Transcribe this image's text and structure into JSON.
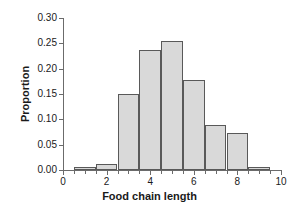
{
  "chart_data": {
    "type": "bar",
    "title": "",
    "xlabel": "Food chain length",
    "ylabel": "Proportion",
    "xlim": [
      0,
      10
    ],
    "ylim": [
      0,
      0.3
    ],
    "grid": false,
    "legend": null,
    "bin_width": 1,
    "categories": [
      "0.5-1.5",
      "1.5-2.5",
      "2.5-3.5",
      "3.5-4.5",
      "4.5-5.5",
      "5.5-6.5",
      "6.5-7.5",
      "7.5-8.5",
      "8.5-9.5"
    ],
    "bin_edges": [
      0.5,
      1.5,
      2.5,
      3.5,
      4.5,
      5.5,
      6.5,
      7.5,
      8.5,
      9.5
    ],
    "bin_centers": [
      1,
      2,
      3,
      4,
      5,
      6,
      7,
      8,
      9
    ],
    "values": [
      0.005,
      0.012,
      0.15,
      0.237,
      0.255,
      0.178,
      0.089,
      0.073,
      0.006
    ],
    "xticks": [
      0,
      0.5,
      1,
      1.5,
      2,
      2.5,
      3,
      3.5,
      4,
      4.5,
      5,
      5.5,
      6,
      6.5,
      7,
      7.5,
      8,
      8.5,
      9,
      9.5,
      10
    ],
    "xtick_labels": [
      {
        "value": 0,
        "label": "0"
      },
      {
        "value": 2,
        "label": "2"
      },
      {
        "value": 4,
        "label": "4"
      },
      {
        "value": 6,
        "label": "6"
      },
      {
        "value": 8,
        "label": "8"
      },
      {
        "value": 10,
        "label": "10"
      }
    ],
    "yticks": [
      0,
      0.05,
      0.1,
      0.15,
      0.2,
      0.25,
      0.3
    ],
    "ytick_labels": [
      "0.00",
      "0.05",
      "0.10",
      "0.15",
      "0.20",
      "0.25",
      "0.30"
    ],
    "colors": {
      "bar_fill": "#d9d9d9",
      "bar_edge": "#595959",
      "axis": "#6b6b6b",
      "text": "#1a1a1a",
      "background": "#ffffff"
    }
  }
}
